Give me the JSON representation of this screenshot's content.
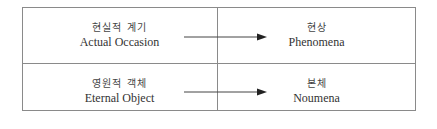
{
  "rows": [
    {
      "source": {
        "korean": "현실적 계기",
        "english": "Actual Occasion"
      },
      "target": {
        "korean": "현상",
        "english": "Phenomena"
      }
    },
    {
      "source": {
        "korean": "영원적 객체",
        "english": "Eternal Object"
      },
      "target": {
        "korean": "본체",
        "english": "Noumena"
      }
    }
  ],
  "colors": {
    "border": "#8a8a8a",
    "arrow": "#222222",
    "text": "#333333"
  }
}
